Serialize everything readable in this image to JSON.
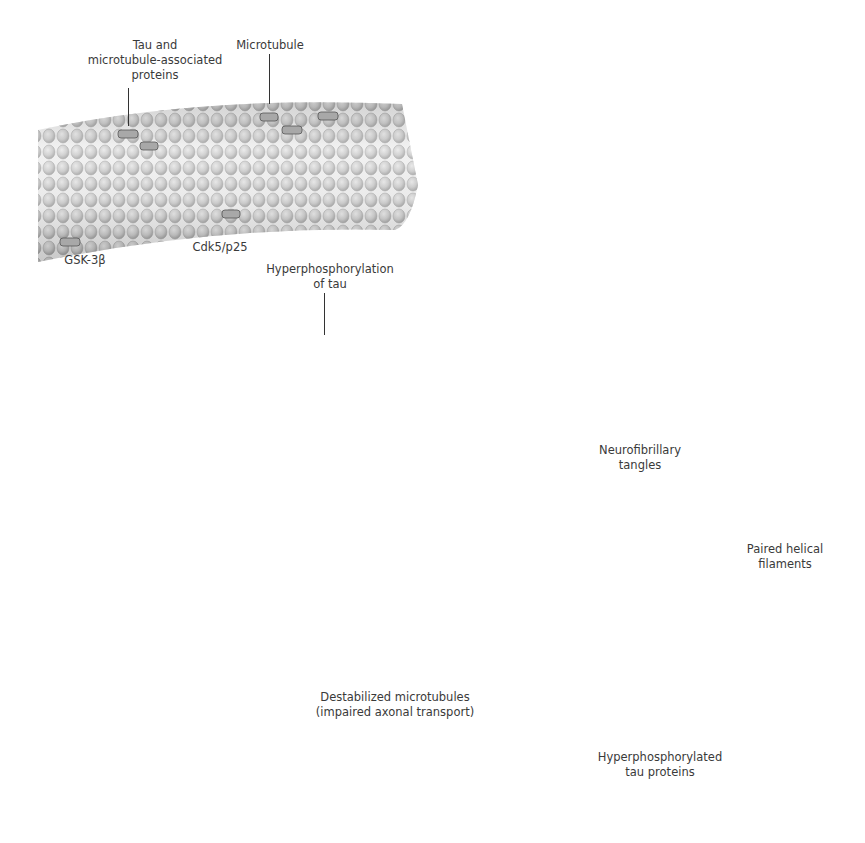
{
  "diagram": {
    "title": "",
    "colors": {
      "background": "#ffffff",
      "tubulin_light": "#e6e6e6",
      "tubulin_mid": "#b8b8b8",
      "tubulin_dark": "#7a7a7a",
      "arrow": "#d9d9d9",
      "text": "#3a3a3a",
      "tangle_halo": "#9a9a9a"
    },
    "labels": {
      "tau_map": [
        "Tau and",
        "microtubule-associated",
        "proteins"
      ],
      "microtubule": [
        "Microtubule"
      ],
      "gsk3b": [
        "GSK-3β"
      ],
      "cdk5": [
        "Cdk5/p25"
      ],
      "hyperphosphorylation": [
        "Hyperphosphorylation",
        "of tau"
      ],
      "destabilized": [
        "Destabilized microtubules",
        "(impaired axonal transport)"
      ],
      "hyperphosphorylated_tau": [
        "Hyperphosphorylated",
        "tau proteins"
      ],
      "paired_helical": [
        "Paired helical",
        "filaments"
      ],
      "tangles": [
        "Neurofibrillary",
        "tangles"
      ]
    },
    "stages": [
      {
        "id": "normal-microtubule",
        "description": "Stable microtubule with tau and microtubule-associated proteins"
      },
      {
        "id": "kinase-action",
        "description": "GSK-3β and Cdk5/p25 phosphorylate tau"
      },
      {
        "id": "hyperphosphorylated-microtubule",
        "description": "Hyperphosphorylation of tau on microtubule"
      },
      {
        "id": "destabilized-microtubule",
        "description": "Destabilized microtubules (impaired axonal transport)"
      },
      {
        "id": "free-tau",
        "description": "Hyperphosphorylated tau proteins"
      },
      {
        "id": "phf",
        "description": "Paired helical filaments"
      },
      {
        "id": "nft",
        "description": "Neurofibrillary tangles"
      }
    ]
  }
}
